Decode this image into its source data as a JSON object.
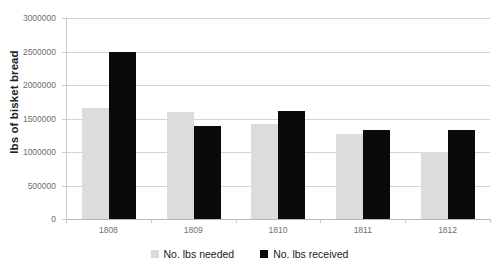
{
  "chart_data": {
    "type": "bar",
    "title": "",
    "xlabel": "",
    "ylabel": "lbs of bisket bread",
    "categories": [
      "1808",
      "1809",
      "1810",
      "1811",
      "1812"
    ],
    "series": [
      {
        "name": "No. lbs needed",
        "color": "#dcdcdc",
        "values": [
          1650000,
          1600000,
          1420000,
          1270000,
          1000000
        ]
      },
      {
        "name": "No. lbs received",
        "color": "#0a0a0a",
        "values": [
          2500000,
          1385000,
          1610000,
          1335000,
          1325000
        ]
      }
    ],
    "ylim": [
      0,
      3000000
    ],
    "yticks": [
      0,
      500000,
      1000000,
      1500000,
      2000000,
      2500000,
      3000000
    ],
    "ytick_labels": [
      "0",
      "500000",
      "1000000",
      "1500000",
      "2000000",
      "2500000",
      "3000000"
    ],
    "grid": true,
    "legend_position": "bottom"
  },
  "legend": {
    "items": [
      {
        "label": "No. lbs needed",
        "swatch": "needed"
      },
      {
        "label": "No. lbs received",
        "swatch": "received"
      }
    ]
  },
  "colors": {
    "needed": "#dcdcdc",
    "received": "#0a0a0a",
    "gridline": "#d4d4d4",
    "axis_text": "#6f6f6f",
    "label_text": "#1a1a1a"
  }
}
